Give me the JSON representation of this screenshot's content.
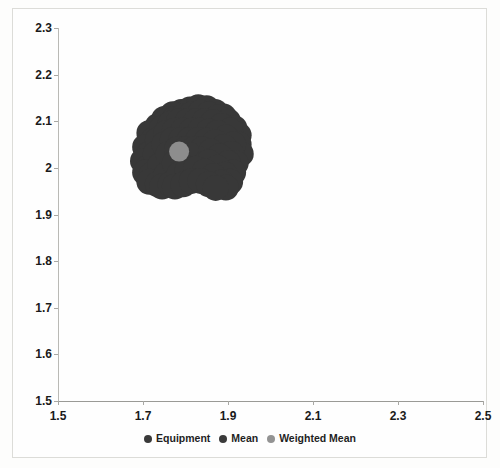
{
  "chart_data": {
    "type": "scatter",
    "title": "",
    "xlabel": "",
    "ylabel": "",
    "xlim": [
      1.5,
      2.5
    ],
    "ylim": [
      1.5,
      2.3
    ],
    "grid": false,
    "legend_position": "bottom",
    "x_ticks": [
      "1.5",
      "1.7",
      "1.9",
      "2.1",
      "2.3",
      "2.5"
    ],
    "x_tick_values": [
      1.5,
      1.7,
      1.9,
      2.1,
      2.3,
      2.5
    ],
    "y_ticks": [
      "2.3",
      "2.2",
      "2.1",
      "2",
      "1.9",
      "1.8",
      "1.7",
      "1.6",
      "1.5"
    ],
    "y_tick_values": [
      2.3,
      2.2,
      2.1,
      2.0,
      1.9,
      1.8,
      1.7,
      1.6,
      1.5
    ],
    "series": [
      {
        "name": "Equipment",
        "color": "#383838",
        "marker": "circle",
        "note": "dense overlapping cluster forming a dark blob",
        "x_range": [
          1.695,
          1.935
        ],
        "y_range": [
          1.955,
          2.135
        ],
        "points": [
          [
            1.79,
            2.12
          ],
          [
            1.81,
            2.125
          ],
          [
            1.83,
            2.13
          ],
          [
            1.85,
            2.128
          ],
          [
            1.87,
            2.12
          ],
          [
            1.77,
            2.115
          ],
          [
            1.75,
            2.105
          ],
          [
            1.89,
            2.11
          ],
          [
            1.9,
            2.1
          ],
          [
            1.735,
            2.09
          ],
          [
            1.755,
            2.1
          ],
          [
            1.775,
            2.105
          ],
          [
            1.795,
            2.11
          ],
          [
            1.815,
            2.115
          ],
          [
            1.835,
            2.118
          ],
          [
            1.855,
            2.115
          ],
          [
            1.875,
            2.108
          ],
          [
            1.895,
            2.098
          ],
          [
            1.915,
            2.085
          ],
          [
            1.925,
            2.07
          ],
          [
            1.715,
            2.075
          ],
          [
            1.725,
            2.06
          ],
          [
            1.745,
            2.085
          ],
          [
            1.765,
            2.095
          ],
          [
            1.785,
            2.1
          ],
          [
            1.805,
            2.1
          ],
          [
            1.825,
            2.1
          ],
          [
            1.845,
            2.1
          ],
          [
            1.865,
            2.098
          ],
          [
            1.885,
            2.09
          ],
          [
            1.905,
            2.08
          ],
          [
            1.925,
            2.05
          ],
          [
            1.93,
            2.03
          ],
          [
            1.705,
            2.045
          ],
          [
            1.715,
            2.03
          ],
          [
            1.735,
            2.06
          ],
          [
            1.755,
            2.075
          ],
          [
            1.775,
            2.08
          ],
          [
            1.795,
            2.08
          ],
          [
            1.815,
            2.08
          ],
          [
            1.835,
            2.08
          ],
          [
            1.855,
            2.078
          ],
          [
            1.875,
            2.075
          ],
          [
            1.895,
            2.065
          ],
          [
            1.912,
            2.05
          ],
          [
            1.7,
            2.015
          ],
          [
            1.712,
            2.0
          ],
          [
            1.73,
            2.03
          ],
          [
            1.75,
            2.05
          ],
          [
            1.77,
            2.06
          ],
          [
            1.79,
            2.06
          ],
          [
            1.81,
            2.06
          ],
          [
            1.83,
            2.06
          ],
          [
            1.85,
            2.058
          ],
          [
            1.87,
            2.055
          ],
          [
            1.89,
            2.045
          ],
          [
            1.908,
            2.03
          ],
          [
            1.918,
            2.01
          ],
          [
            1.705,
            1.99
          ],
          [
            1.72,
            1.985
          ],
          [
            1.74,
            2.005
          ],
          [
            1.76,
            2.03
          ],
          [
            1.78,
            2.04
          ],
          [
            1.8,
            2.04
          ],
          [
            1.82,
            2.04
          ],
          [
            1.84,
            2.04
          ],
          [
            1.86,
            2.035
          ],
          [
            1.88,
            2.025
          ],
          [
            1.9,
            2.01
          ],
          [
            1.912,
            1.99
          ],
          [
            1.715,
            1.97
          ],
          [
            1.735,
            1.965
          ],
          [
            1.755,
            1.985
          ],
          [
            1.775,
            2.01
          ],
          [
            1.795,
            2.02
          ],
          [
            1.815,
            2.02
          ],
          [
            1.835,
            2.018
          ],
          [
            1.855,
            2.012
          ],
          [
            1.875,
            2.0
          ],
          [
            1.893,
            1.985
          ],
          [
            1.905,
            1.97
          ],
          [
            1.745,
            1.96
          ],
          [
            1.765,
            1.965
          ],
          [
            1.785,
            1.985
          ],
          [
            1.805,
            1.995
          ],
          [
            1.825,
            1.998
          ],
          [
            1.845,
            1.992
          ],
          [
            1.865,
            1.982
          ],
          [
            1.883,
            1.968
          ],
          [
            1.895,
            1.958
          ],
          [
            1.775,
            1.96
          ],
          [
            1.795,
            1.965
          ],
          [
            1.815,
            1.972
          ],
          [
            1.835,
            1.972
          ],
          [
            1.855,
            1.965
          ],
          [
            1.871,
            1.957
          ]
        ]
      },
      {
        "name": "Mean",
        "color": "#383838",
        "marker": "circle",
        "x": 1.815,
        "y": 2.04
      },
      {
        "name": "Weighted Mean",
        "color": "#8d8d8d",
        "marker": "circle",
        "x": 1.785,
        "y": 2.035
      }
    ]
  },
  "legend": {
    "items": [
      {
        "label": "Equipment",
        "color": "#3a3a3a"
      },
      {
        "label": "Mean",
        "color": "#3a3a3a"
      },
      {
        "label": "Weighted Mean",
        "color": "#939393"
      }
    ]
  },
  "axes": {
    "y_labels": [
      "2.3",
      "2.2",
      "2.1",
      "2",
      "1.9",
      "1.8",
      "1.7",
      "1.6",
      "1.5"
    ],
    "x_labels": [
      "1.5",
      "1.7",
      "1.9",
      "2.1",
      "2.3",
      "2.5"
    ]
  }
}
